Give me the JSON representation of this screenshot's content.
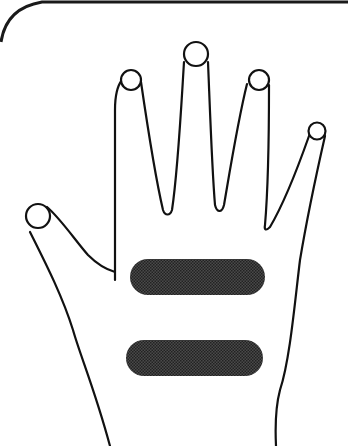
{
  "figure": {
    "colors": {
      "background": "#ffffff",
      "outline": "#111111",
      "band_fill": "#3a3a3a",
      "frame": "#1a1a1a"
    },
    "parts": {
      "frame": "rounded-corner frame",
      "thumb": "thumb",
      "index": "index finger",
      "middle": "middle finger",
      "ring": "ring finger",
      "pinky": "little finger",
      "palm": "palm",
      "band_upper": "upper shaded band",
      "band_lower": "lower shaded band"
    }
  }
}
